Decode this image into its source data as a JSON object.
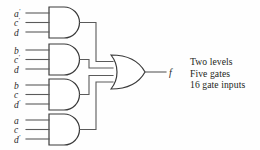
{
  "diagram": {
    "output": {
      "label": "f"
    },
    "gates": [
      {
        "name": "and-gate-1",
        "type": "AND",
        "inputs": [
          {
            "var": "a",
            "primed": true,
            "text": "a′"
          },
          {
            "var": "c",
            "primed": true,
            "text": "c′"
          },
          {
            "var": "d",
            "primed": false,
            "text": "d"
          }
        ]
      },
      {
        "name": "and-gate-2",
        "type": "AND",
        "inputs": [
          {
            "var": "b",
            "primed": false,
            "text": "b"
          },
          {
            "var": "c",
            "primed": true,
            "text": "c′"
          },
          {
            "var": "d",
            "primed": false,
            "text": "d"
          }
        ]
      },
      {
        "name": "and-gate-3",
        "type": "AND",
        "inputs": [
          {
            "var": "b",
            "primed": false,
            "text": "b"
          },
          {
            "var": "c",
            "primed": false,
            "text": "c"
          },
          {
            "var": "d",
            "primed": true,
            "text": "d′"
          }
        ]
      },
      {
        "name": "and-gate-4",
        "type": "AND",
        "inputs": [
          {
            "var": "a",
            "primed": false,
            "text": "a"
          },
          {
            "var": "c",
            "primed": false,
            "text": "c"
          },
          {
            "var": "d",
            "primed": true,
            "text": "d′"
          }
        ]
      }
    ],
    "or_gate": {
      "name": "or-gate",
      "type": "OR",
      "input_count": 4
    }
  },
  "labels": {
    "g1_i1": "a",
    "g1_i1_p": "′",
    "g1_i2": "c",
    "g1_i2_p": "′",
    "g1_i3": "d",
    "g1_i3_p": "",
    "g2_i1": "b",
    "g2_i1_p": "",
    "g2_i2": "c",
    "g2_i2_p": "′",
    "g2_i3": "d",
    "g2_i3_p": "",
    "g3_i1": "b",
    "g3_i1_p": "",
    "g3_i2": "c",
    "g3_i2_p": "",
    "g3_i3": "d",
    "g3_i3_p": "′",
    "g4_i1": "a",
    "g4_i1_p": "",
    "g4_i2": "c",
    "g4_i2_p": "",
    "g4_i3": "d",
    "g4_i3_p": "′",
    "output": "f"
  },
  "notes": {
    "line1": "Two levels",
    "line2": "Five gates",
    "line3": "16 gate inputs"
  },
  "metrics": {
    "levels": 2,
    "gate_count": 5,
    "gate_inputs": 16
  },
  "colors": {
    "background": "#fefefe",
    "wire": "#5a5a5a",
    "gate_outline": "#3a3a3a",
    "text": "#231f20"
  }
}
